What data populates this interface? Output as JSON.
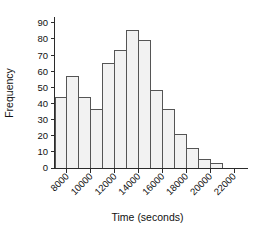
{
  "chart_data": {
    "type": "bar",
    "title": "",
    "subtitle": "",
    "xlabel": "Time (seconds)",
    "ylabel": "Frequency",
    "grid": false,
    "legend": null,
    "legend_position": "none",
    "bin_width": 1000,
    "bin_edges": [
      7000,
      8000,
      9000,
      10000,
      11000,
      12000,
      13000,
      14000,
      15000,
      16000,
      17000,
      18000,
      19000,
      20000,
      21000,
      22000
    ],
    "categories": [
      "7000-8000",
      "8000-9000",
      "9000-10000",
      "10000-11000",
      "11000-12000",
      "12000-13000",
      "13000-14000",
      "14000-15000",
      "15000-16000",
      "16000-17000",
      "17000-18000",
      "18000-19000",
      "19000-20000",
      "20000-21000",
      "21000-22000"
    ],
    "values": [
      44,
      57,
      44,
      36,
      65,
      73,
      85,
      79,
      48,
      36,
      21,
      12,
      5,
      3,
      0
    ],
    "xlim": [
      7000,
      22500
    ],
    "ylim": [
      0,
      93
    ],
    "xticks": [
      8000,
      10000,
      12000,
      14000,
      16000,
      18000,
      20000,
      22000
    ],
    "xtick_labels": [
      "8000",
      "10000",
      "12000",
      "14000",
      "16000",
      "18000",
      "20000",
      "22000"
    ],
    "xtick_rotation": 45,
    "yticks": [
      0,
      10,
      20,
      30,
      40,
      50,
      60,
      70,
      80,
      90
    ],
    "ytick_labels": [
      "0",
      "10",
      "20",
      "30",
      "40",
      "50",
      "60",
      "70",
      "80",
      "90"
    ],
    "colors": {
      "bar_fill": "#f2f2f2",
      "bar_stroke": "#555555",
      "axis": "#2b2b2b",
      "text": "#111111",
      "background": "#ffffff"
    }
  }
}
